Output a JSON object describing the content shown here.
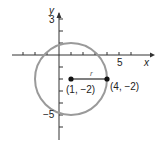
{
  "figure": {
    "axes": {
      "x_label": "x",
      "y_label": "y",
      "x_tick_label": "5",
      "y_tick_labels": [
        "3",
        "−5"
      ]
    },
    "circle": {
      "center": [
        1,
        -2
      ],
      "radius": 3,
      "color": "#9a9a9a"
    },
    "radius_label": "r",
    "points": [
      {
        "label": "(1, −2)",
        "x": 1,
        "y": -2
      },
      {
        "label": "(4, −2)",
        "x": 4,
        "y": -2
      }
    ]
  }
}
